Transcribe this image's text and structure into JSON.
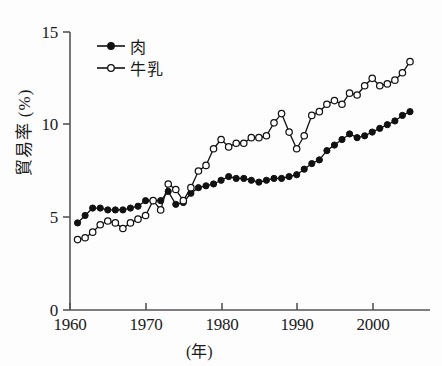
{
  "chart_data": {
    "type": "line",
    "title": "",
    "xlabel": "(年)",
    "ylabel": "貿易率 (%)",
    "xlim": [
      1960,
      2005
    ],
    "ylim": [
      0,
      15
    ],
    "xticks": [
      1960,
      1970,
      1980,
      1990,
      2000
    ],
    "yticks": [
      0,
      5,
      10,
      15
    ],
    "grid": false,
    "legend_position": "top-left",
    "x": [
      1961,
      1962,
      1963,
      1964,
      1965,
      1966,
      1967,
      1968,
      1969,
      1970,
      1971,
      1972,
      1973,
      1974,
      1975,
      1976,
      1977,
      1978,
      1979,
      1980,
      1981,
      1982,
      1983,
      1984,
      1985,
      1986,
      1987,
      1988,
      1989,
      1990,
      1991,
      1992,
      1993,
      1994,
      1995,
      1996,
      1997,
      1998,
      1999,
      2000,
      2001,
      2002,
      2003,
      2004,
      2005
    ],
    "series": [
      {
        "name": "肉",
        "marker": "filled-circle",
        "color": "#111111",
        "values": [
          4.7,
          5.1,
          5.5,
          5.5,
          5.4,
          5.4,
          5.4,
          5.5,
          5.6,
          5.9,
          5.9,
          5.9,
          6.4,
          5.7,
          5.8,
          6.3,
          6.6,
          6.7,
          6.8,
          7.0,
          7.2,
          7.1,
          7.1,
          7.0,
          6.9,
          7.0,
          7.1,
          7.1,
          7.2,
          7.3,
          7.6,
          7.9,
          8.1,
          8.6,
          8.9,
          9.2,
          9.5,
          9.3,
          9.4,
          9.6,
          9.8,
          10.0,
          10.2,
          10.5,
          10.7
        ]
      },
      {
        "name": "牛乳",
        "marker": "open-circle",
        "color": "#111111",
        "values": [
          3.8,
          3.9,
          4.2,
          4.6,
          4.8,
          4.7,
          4.4,
          4.7,
          4.9,
          5.1,
          5.9,
          5.4,
          6.8,
          6.5,
          5.9,
          6.6,
          7.5,
          7.8,
          8.7,
          9.2,
          8.8,
          9.0,
          9.0,
          9.3,
          9.3,
          9.4,
          10.1,
          10.6,
          9.6,
          8.7,
          9.4,
          10.5,
          10.7,
          11.1,
          11.3,
          11.1,
          11.7,
          11.6,
          12.1,
          12.5,
          12.1,
          12.2,
          12.4,
          12.8,
          13.4
        ]
      }
    ]
  },
  "axis": {
    "ytick_labels": [
      "0",
      "5",
      "10",
      "15"
    ],
    "xtick_labels": [
      "1960",
      "1970",
      "1980",
      "1990",
      "2000"
    ],
    "ylabel_text": "貿易率 (%)",
    "xlabel_text": "(年)"
  },
  "legend": {
    "entries": [
      {
        "label": "肉",
        "marker": "filled-circle"
      },
      {
        "label": "牛乳",
        "marker": "open-circle"
      }
    ]
  }
}
